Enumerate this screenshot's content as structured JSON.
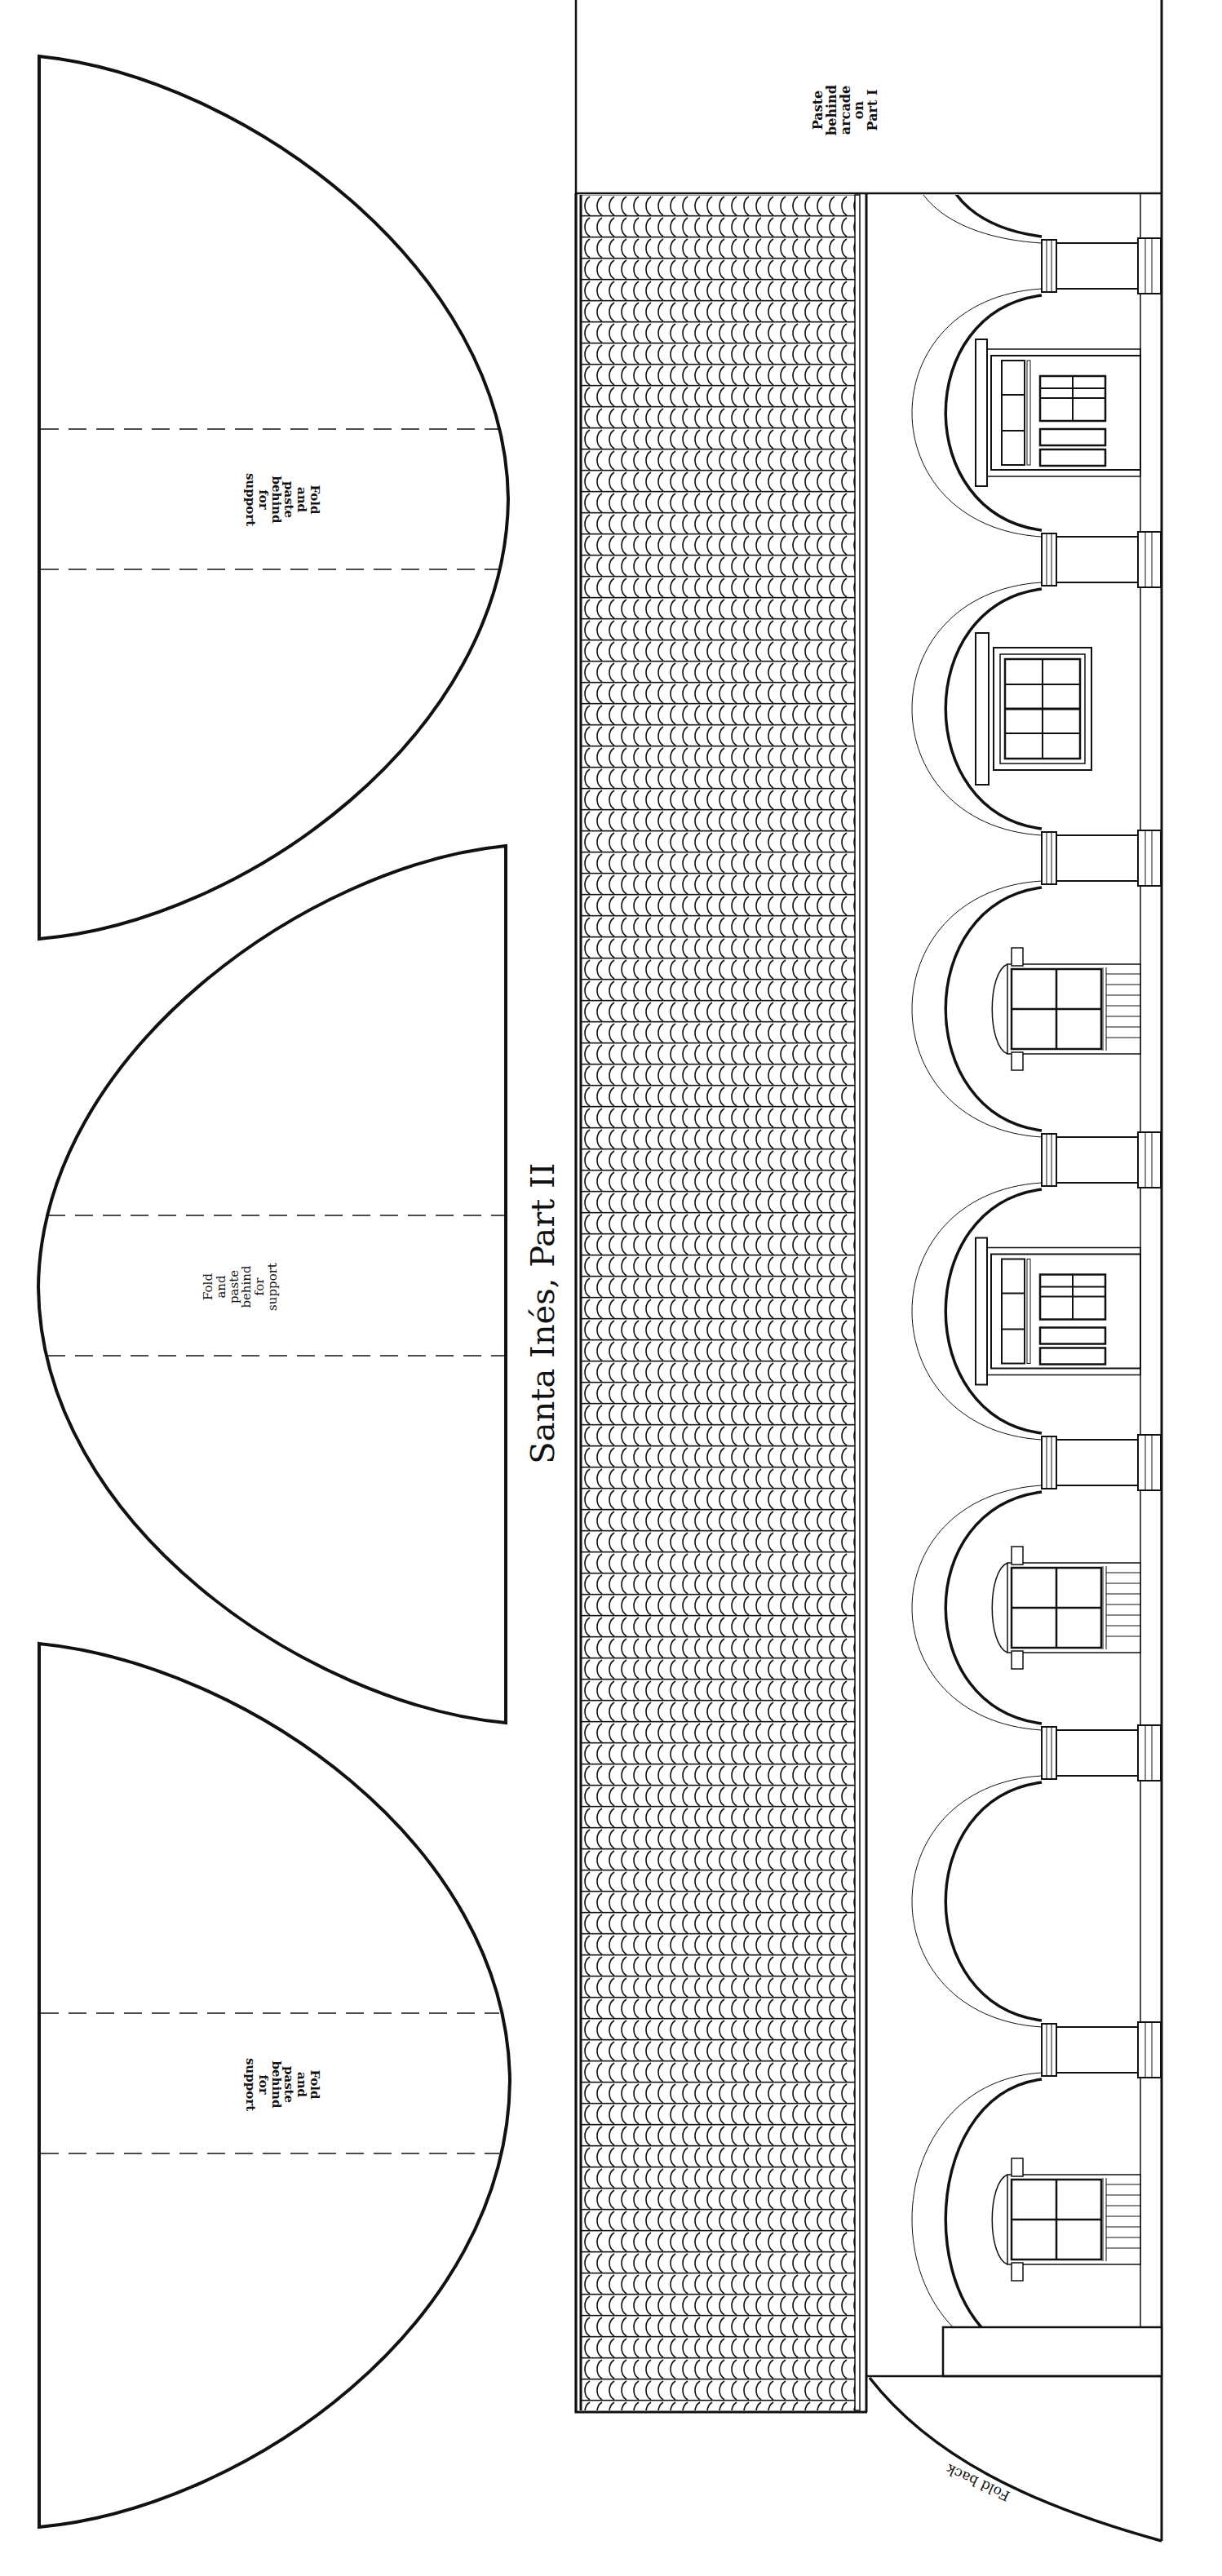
{
  "page": {
    "title": "Santa Inés, Part II",
    "stroke_color": "#111111",
    "background": "#ffffff"
  },
  "support_pieces": [
    {
      "id": "support-1",
      "label_lines": [
        "Fold",
        "and",
        "paste",
        "behind",
        "for",
        "support"
      ],
      "top": 69,
      "bottom": 1151,
      "apex_x": 623,
      "fold_lines_y": [
        526,
        698
      ],
      "orientation": "curve-right"
    },
    {
      "id": "support-2",
      "label_lines": [
        "Fold",
        "and",
        "paste",
        "behind",
        "for",
        "support"
      ],
      "top": 1037,
      "bottom": 2112,
      "apex_x": 47,
      "fold_lines_y": [
        1490,
        1662
      ],
      "orientation": "curve-left"
    },
    {
      "id": "support-3",
      "label_lines": [
        "Fold",
        "and",
        "paste",
        "behind",
        "for",
        "support"
      ],
      "top": 2015,
      "bottom": 3098,
      "apex_x": 625,
      "fold_lines_y": [
        2468,
        2640
      ],
      "orientation": "curve-right"
    }
  ],
  "support_label_text": "Fold\nand\npaste\nbehind\nfor\nsupport",
  "paste_tab": {
    "label": "Paste\nbehind\narcade\non\nPart I"
  },
  "fold_back_tab": {
    "label": "Fold back"
  },
  "arcade": {
    "columns_y": [
      290,
      650,
      1016,
      1386,
      1757,
      2113,
      2477
    ],
    "bays": [
      {
        "type": "door"
      },
      {
        "type": "window-large"
      },
      {
        "type": "window-small"
      },
      {
        "type": "door"
      },
      {
        "type": "window-small"
      },
      {
        "type": "empty"
      },
      {
        "type": "window-small"
      }
    ]
  }
}
